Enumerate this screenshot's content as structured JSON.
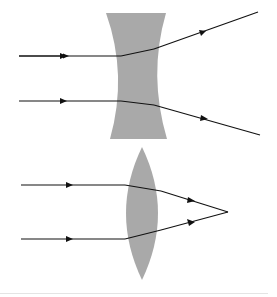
{
  "diagram": {
    "type": "lens ray diagram",
    "colors": {
      "background": "#ffffff",
      "lens_fill": "#a9a9a9",
      "ray": "#111111"
    },
    "panels": [
      {
        "id": "concave-lens",
        "lens": "diverging (concave)",
        "rays": [
          {
            "direction": "diverges upward after lens"
          },
          {
            "direction": "diverges downward after lens"
          }
        ]
      },
      {
        "id": "convex-lens",
        "lens": "converging (convex)",
        "rays": [
          {
            "direction": "converges to focal point"
          },
          {
            "direction": "converges to focal point"
          }
        ]
      }
    ]
  }
}
